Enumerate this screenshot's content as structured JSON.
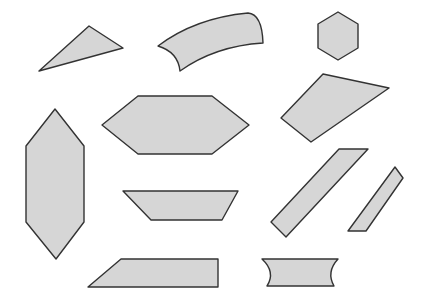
{
  "canvas": {
    "width": 425,
    "height": 304,
    "background": "#ffffff"
  },
  "style": {
    "fill": "#d6d6d6",
    "stroke": "#333333",
    "stroke_width": 1.4
  },
  "shapes": [
    {
      "id": "triangle",
      "type": "polygon",
      "points": "89,26 123,48 39,71"
    },
    {
      "id": "curved-band",
      "type": "path",
      "d": "M158,46 Q195,18 248,13 Q262,14 263,43 Q215,46 180,71 Q178,52 158,46 Z"
    },
    {
      "id": "small-hexagon",
      "type": "polygon",
      "points": "338,12 358,24 358,48 338,60 318,48 318,24"
    },
    {
      "id": "quadrilateral",
      "type": "polygon",
      "points": "323,74 389,88 311,142 281,118"
    },
    {
      "id": "wide-hexagon",
      "type": "polygon",
      "points": "102,125 138,96 212,96 249,125 212,154 138,154"
    },
    {
      "id": "tall-hexagon",
      "type": "polygon",
      "points": "55,109 84,146 84,222 56,259 26,222 26,146"
    },
    {
      "id": "trapezoid",
      "type": "polygon",
      "points": "123,191 238,191 222,220 151,220"
    },
    {
      "id": "long-parallelogram",
      "type": "polygon",
      "points": "339,149 368,149 286,237 271,222"
    },
    {
      "id": "thin-parallelogram",
      "type": "polygon",
      "points": "395,167 403,178 366,231 348,231"
    },
    {
      "id": "bottom-trapezoid",
      "type": "polygon",
      "points": "121,259 218,259 218,287 88,287"
    },
    {
      "id": "concave-rectangle",
      "type": "path",
      "d": "M262,259 L338,259 Q326,272 334,286 L267,286 Q276,272 262,259 Z"
    }
  ]
}
